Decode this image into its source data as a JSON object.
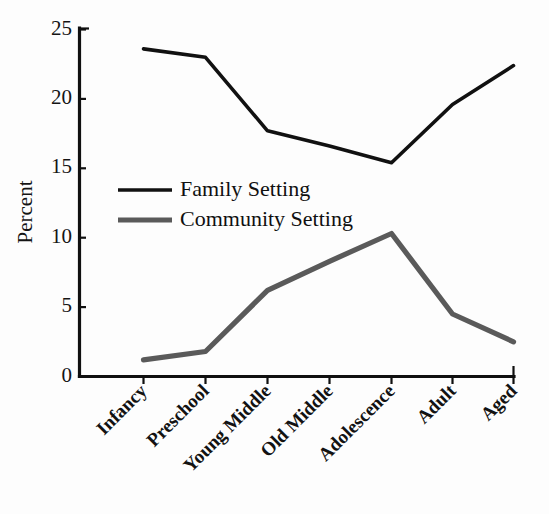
{
  "chart_data": {
    "type": "line",
    "title": "",
    "subtitle": "",
    "xlabel": "",
    "ylabel": "Percent",
    "categories": [
      "Infancy",
      "Preschool",
      "Young Middle",
      "Old Middle",
      "Adolescence",
      "Adult",
      "Aged"
    ],
    "series": [
      {
        "name": "Family Setting",
        "color": "#111111",
        "values": [
          23.6,
          23.0,
          17.7,
          16.6,
          15.4,
          19.6,
          22.4
        ]
      },
      {
        "name": "Community Setting",
        "color": "#5a5a5a",
        "values": [
          1.2,
          1.8,
          6.2,
          8.3,
          10.3,
          4.5,
          2.5
        ]
      }
    ],
    "ylim": [
      0,
      25
    ],
    "yticks": [
      0,
      5,
      10,
      15,
      20,
      25
    ],
    "ytick_labels": [
      "0",
      "5",
      "10",
      "15",
      "20",
      "25"
    ],
    "grid": false,
    "legend_position": "inside-upper-left",
    "xtick_rotation_deg": -45
  },
  "legend": {
    "entries": [
      {
        "label": "Family Setting",
        "color": "#111111"
      },
      {
        "label": "Community Setting",
        "color": "#5a5a5a"
      }
    ]
  },
  "axes": {
    "y_title": "Percent"
  },
  "colors": {
    "family": "#111111",
    "community": "#5a5a5a",
    "axis": "#101010",
    "background": "#fdfdfd"
  }
}
